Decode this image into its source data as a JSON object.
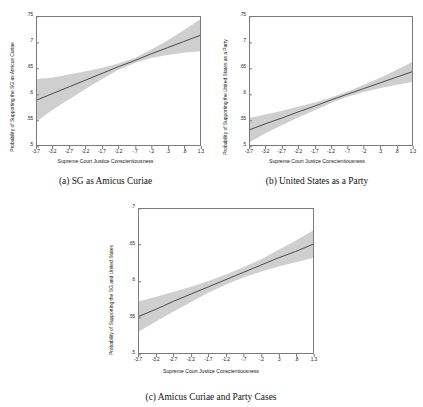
{
  "figure": {
    "panels": [
      {
        "id": "a",
        "caption": "(a) SG as Amicus Curiae",
        "ylabel": "Probability of Supporting the SG as Amicus Curiae",
        "xlabel": "Supreme Court Justice Conscientiousness"
      },
      {
        "id": "b",
        "caption": "(b) United States as a Party",
        "ylabel": "Probability of Supporting the United States as a Party",
        "xlabel": "Supreme Court Justice Conscientiousness"
      },
      {
        "id": "c",
        "caption": "(c) Amicus Curiae and Party Cases",
        "ylabel": "Probability of Supporting the SG and United States",
        "xlabel": "Supreme Court Justice Conscientiousness"
      }
    ]
  },
  "chart_data": [
    {
      "type": "line",
      "panel": "a",
      "title": "(a) SG as Amicus Curiae",
      "xlabel": "Supreme Court Justice Conscientiousness",
      "ylabel": "Probability of Supporting the SG as Amicus Curiae",
      "xlim": [
        -3.7,
        1.3
      ],
      "ylim": [
        0.5,
        0.75
      ],
      "xticks": [
        -3.7,
        -3.2,
        -2.7,
        -2.2,
        -1.7,
        -1.2,
        -0.7,
        -0.2,
        0.3,
        0.8,
        1.3
      ],
      "xticklabels": [
        "-3.7",
        "-3.2",
        "-2.7",
        "-2.2",
        "-1.7",
        "-1.2",
        "-.7",
        "-.2",
        ".3",
        ".8",
        "1.3"
      ],
      "yticks": [
        0.5,
        0.55,
        0.6,
        0.65,
        0.7,
        0.75
      ],
      "yticklabels": [
        ".5",
        ".55",
        ".6",
        ".65",
        ".7",
        ".75"
      ],
      "grid": false,
      "legend": "none",
      "series": [
        {
          "name": "predicted probability",
          "x": [
            -3.7,
            -3.2,
            -2.7,
            -2.2,
            -1.7,
            -1.2,
            -0.7,
            -0.2,
            0.3,
            0.8,
            1.3
          ],
          "values": [
            0.588,
            0.601,
            0.614,
            0.627,
            0.64,
            0.653,
            0.665,
            0.678,
            0.69,
            0.702,
            0.714
          ]
        },
        {
          "name": "95% CI upper",
          "x": [
            -3.7,
            -3.2,
            -2.7,
            -2.2,
            -1.7,
            -1.2,
            -0.7,
            -0.2,
            0.3,
            0.8,
            1.3
          ],
          "values": [
            0.629,
            0.632,
            0.638,
            0.644,
            0.651,
            0.659,
            0.67,
            0.686,
            0.704,
            0.724,
            0.745
          ]
        },
        {
          "name": "95% CI lower",
          "x": [
            -3.7,
            -3.2,
            -2.7,
            -2.2,
            -1.7,
            -1.2,
            -0.7,
            -0.2,
            0.3,
            0.8,
            1.3
          ],
          "values": [
            0.547,
            0.57,
            0.59,
            0.61,
            0.629,
            0.647,
            0.66,
            0.67,
            0.676,
            0.68,
            0.683
          ]
        }
      ]
    },
    {
      "type": "line",
      "panel": "b",
      "title": "(b) United States as a Party",
      "xlabel": "Supreme Court Justice Conscientiousness",
      "ylabel": "Probability of Supporting the United States as a Party",
      "xlim": [
        -3.7,
        1.3
      ],
      "ylim": [
        0.5,
        0.75
      ],
      "xticks": [
        -3.7,
        -3.2,
        -2.7,
        -2.2,
        -1.7,
        -1.2,
        -0.7,
        -0.2,
        0.3,
        0.8,
        1.3
      ],
      "xticklabels": [
        "-3.7",
        "-3.2",
        "-2.7",
        "-2.2",
        "-1.7",
        "-1.2",
        "-.7",
        "-.2",
        ".3",
        ".8",
        "1.3"
      ],
      "yticks": [
        0.5,
        0.55,
        0.6,
        0.65,
        0.7,
        0.75
      ],
      "yticklabels": [
        ".5",
        ".55",
        ".6",
        ".65",
        ".7",
        ".75"
      ],
      "grid": false,
      "legend": "none",
      "series": [
        {
          "name": "predicted probability",
          "x": [
            -3.7,
            -3.2,
            -2.7,
            -2.2,
            -1.7,
            -1.2,
            -0.7,
            -0.2,
            0.3,
            0.8,
            1.3
          ],
          "values": [
            0.53,
            0.542,
            0.553,
            0.565,
            0.576,
            0.588,
            0.599,
            0.61,
            0.621,
            0.632,
            0.643
          ]
        },
        {
          "name": "95% CI upper",
          "x": [
            -3.7,
            -3.2,
            -2.7,
            -2.2,
            -1.7,
            -1.2,
            -0.7,
            -0.2,
            0.3,
            0.8,
            1.3
          ],
          "values": [
            0.553,
            0.56,
            0.567,
            0.575,
            0.583,
            0.593,
            0.604,
            0.617,
            0.631,
            0.646,
            0.662
          ]
        },
        {
          "name": "95% CI lower",
          "x": [
            -3.7,
            -3.2,
            -2.7,
            -2.2,
            -1.7,
            -1.2,
            -0.7,
            -0.2,
            0.3,
            0.8,
            1.3
          ],
          "values": [
            0.506,
            0.524,
            0.539,
            0.554,
            0.568,
            0.582,
            0.594,
            0.603,
            0.611,
            0.617,
            0.623
          ]
        }
      ]
    },
    {
      "type": "line",
      "panel": "c",
      "title": "(c) Amicus Curiae and Party Cases",
      "xlabel": "Supreme Court Justice Conscientiousness",
      "ylabel": "Probability of Supporting the SG and United States",
      "xlim": [
        -3.7,
        1.3
      ],
      "ylim": [
        0.5,
        0.7
      ],
      "xticks": [
        -3.7,
        -3.2,
        -2.7,
        -2.2,
        -1.7,
        -1.2,
        -0.7,
        -0.2,
        0.3,
        0.8,
        1.3
      ],
      "xticklabels": [
        "-3.7",
        "-3.2",
        "-2.7",
        "-2.2",
        "-1.7",
        "-1.2",
        "-.7",
        "-.2",
        ".3",
        ".8",
        "1.3"
      ],
      "yticks": [
        0.5,
        0.55,
        0.6,
        0.65,
        0.7
      ],
      "yticklabels": [
        ".5",
        ".55",
        ".6",
        ".65",
        ".7"
      ],
      "grid": false,
      "legend": "none",
      "series": [
        {
          "name": "predicted probability",
          "x": [
            -3.7,
            -3.2,
            -2.7,
            -2.2,
            -1.7,
            -1.2,
            -0.7,
            -0.2,
            0.3,
            0.8,
            1.3
          ],
          "values": [
            0.551,
            0.561,
            0.572,
            0.582,
            0.592,
            0.602,
            0.612,
            0.622,
            0.632,
            0.641,
            0.651
          ]
        },
        {
          "name": "95% CI upper",
          "x": [
            -3.7,
            -3.2,
            -2.7,
            -2.2,
            -1.7,
            -1.2,
            -0.7,
            -0.2,
            0.3,
            0.8,
            1.3
          ],
          "values": [
            0.572,
            0.578,
            0.585,
            0.592,
            0.6,
            0.609,
            0.619,
            0.63,
            0.643,
            0.656,
            0.67
          ]
        },
        {
          "name": "95% CI lower",
          "x": [
            -3.7,
            -3.2,
            -2.7,
            -2.2,
            -1.7,
            -1.2,
            -0.7,
            -0.2,
            0.3,
            0.8,
            1.3
          ],
          "values": [
            0.53,
            0.544,
            0.558,
            0.571,
            0.584,
            0.595,
            0.605,
            0.613,
            0.62,
            0.626,
            0.632
          ]
        }
      ]
    }
  ],
  "style": {
    "line_color": "#3c3c3c",
    "band_color": "#cfcfcf",
    "frame_color": "#7b7b7b",
    "background": "#ffffff"
  }
}
